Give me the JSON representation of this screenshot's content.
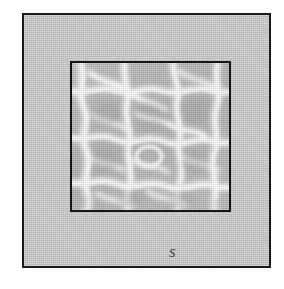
{
  "figure": {
    "name": "square-within-square-diagram",
    "outer_square": {
      "name": "outer-square",
      "fill_color": "#c9c9c9",
      "border_color": "#1a1a1a",
      "border_width_px": 2,
      "left_px": 22,
      "top_px": 13,
      "width_px": 249,
      "height_px": 255
    },
    "inner_square": {
      "name": "inner-textured-square",
      "fill_color": "#b4b4b4",
      "highlight_color": "#f2f2f2",
      "border_color": "#151515",
      "border_width_px": 2,
      "left_px": 70,
      "top_px": 61,
      "width_px": 161,
      "height_px": 151,
      "texture": "water-caustic-mesh"
    },
    "labels": [
      {
        "id": "label-left",
        "text": "s",
        "position": "left-side-of-outer-square",
        "color": "#4a4a4a",
        "style": "italic"
      },
      {
        "id": "label-bottom",
        "text": "s",
        "position": "bottom-side-of-outer-square",
        "color": "#4a4a4a",
        "style": "italic"
      }
    ]
  },
  "canvas": {
    "background_color": "#ffffff",
    "width_px": 284,
    "height_px": 289
  }
}
